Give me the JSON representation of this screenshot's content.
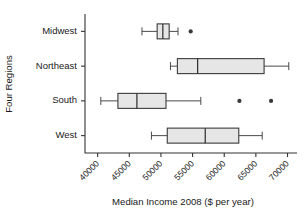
{
  "chart_data": {
    "type": "box",
    "title": "",
    "xlabel": "Median Income 2008 ($ per year)",
    "ylabel": "Four Regions",
    "orientation": "horizontal",
    "xlim": [
      38000,
      71500
    ],
    "xticks": [
      40000,
      45000,
      50000,
      55000,
      60000,
      65000,
      70000
    ],
    "xticklabels": [
      "40000",
      "45000",
      "50000",
      "55000",
      "60000",
      "65000",
      "70000"
    ],
    "grid": false,
    "legend": null,
    "categories": [
      "Midwest",
      "Northeast",
      "South",
      "West"
    ],
    "boxes": [
      {
        "category": "Midwest",
        "whisker_low": 47000,
        "q1": 49400,
        "median": 50300,
        "q3": 51300,
        "whisker_high": 52700,
        "outliers": [
          54700
        ]
      },
      {
        "category": "Northeast",
        "whisker_low": 51500,
        "q1": 52600,
        "median": 55800,
        "q3": 66300,
        "whisker_high": 70200,
        "outliers": []
      },
      {
        "category": "South",
        "whisker_low": 40500,
        "q1": 43200,
        "median": 46200,
        "q3": 50800,
        "whisker_high": 56300,
        "outliers": [
          62400,
          67400
        ]
      },
      {
        "category": "West",
        "whisker_low": 48500,
        "q1": 51000,
        "median": 57000,
        "q3": 62300,
        "whisker_high": 66000,
        "outliers": []
      }
    ],
    "style": {
      "box_fill": "#e6e6e6",
      "box_stroke": "#3a3a3a",
      "axis_color": "#333333",
      "outlier_color": "#3a3a3a"
    }
  }
}
